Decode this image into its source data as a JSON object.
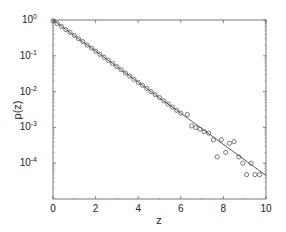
{
  "chart_data": {
    "type": "scatter",
    "title": "",
    "xlabel": "z",
    "ylabel": "p(z)",
    "xlim": [
      0,
      10
    ],
    "ylim": [
      1e-05,
      1
    ],
    "yscale": "log",
    "grid": false,
    "legend": null,
    "x_ticks": [
      0,
      2,
      4,
      6,
      8,
      10
    ],
    "x_tick_labels": [
      "0",
      "2",
      "4",
      "6",
      "8",
      "10"
    ],
    "y_ticks": [
      1,
      0.1,
      0.01,
      0.001,
      0.0001
    ],
    "y_tick_labels": [
      {
        "base": "10",
        "exp": "0"
      },
      {
        "base": "10",
        "exp": "-1"
      },
      {
        "base": "10",
        "exp": "-2"
      },
      {
        "base": "10",
        "exp": "-3"
      },
      {
        "base": "10",
        "exp": "-4"
      }
    ],
    "series": [
      {
        "name": "data",
        "style": "open-circle",
        "x": [
          0.0,
          0.2,
          0.4,
          0.6,
          0.8,
          1.0,
          1.2,
          1.4,
          1.6,
          1.8,
          2.0,
          2.2,
          2.4,
          2.6,
          2.8,
          3.0,
          3.2,
          3.4,
          3.6,
          3.8,
          4.0,
          4.2,
          4.4,
          4.6,
          4.8,
          5.0,
          5.2,
          5.4,
          5.6,
          5.8,
          6.0,
          6.31,
          6.51,
          6.71,
          6.9,
          7.1,
          7.31,
          7.53,
          7.71,
          7.9,
          8.11,
          8.28,
          8.5,
          8.72,
          8.91,
          9.09,
          9.3,
          9.48,
          9.7
        ],
        "y": [
          0.95,
          0.8,
          0.66,
          0.54,
          0.45,
          0.37,
          0.3,
          0.25,
          0.2,
          0.165,
          0.135,
          0.11,
          0.091,
          0.074,
          0.061,
          0.05,
          0.041,
          0.033,
          0.027,
          0.022,
          0.018,
          0.015,
          0.0123,
          0.01,
          0.0082,
          0.0068,
          0.0055,
          0.0045,
          0.0037,
          0.003,
          0.0025,
          0.0023,
          0.0011,
          0.00098,
          0.00089,
          0.00076,
          0.00069,
          0.00045,
          0.00015,
          0.00045,
          0.0002,
          0.00036,
          0.0004,
          0.00015,
          0.0001,
          4.8e-05,
          0.0001,
          4.8e-05,
          4.8e-05
        ]
      },
      {
        "name": "fit exp(-z)",
        "style": "solid-line",
        "x": [
          0,
          10
        ],
        "y": [
          1.0,
          4.54e-05
        ]
      }
    ]
  }
}
